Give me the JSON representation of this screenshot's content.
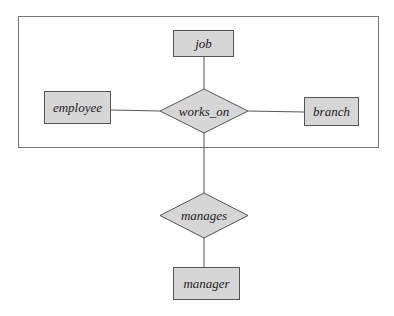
{
  "diagram": {
    "type": "ER diagram (aggregation)",
    "colors": {
      "fill": "#d6d6d6",
      "stroke": "#555555",
      "frame": "#777777",
      "text": "#222222",
      "background": "#ffffff"
    },
    "aggregation_frame": {
      "contains": [
        "job",
        "employee",
        "works_on",
        "branch"
      ]
    },
    "entities": [
      {
        "id": "job",
        "label": "job"
      },
      {
        "id": "employee",
        "label": "employee"
      },
      {
        "id": "branch",
        "label": "branch"
      },
      {
        "id": "manager",
        "label": "manager"
      }
    ],
    "relationships": [
      {
        "id": "works_on",
        "label": "works_on",
        "participants": [
          "employee",
          "job",
          "branch"
        ]
      },
      {
        "id": "manages",
        "label": "manages",
        "participants": [
          "works_on (aggregation)",
          "manager"
        ]
      }
    ]
  }
}
